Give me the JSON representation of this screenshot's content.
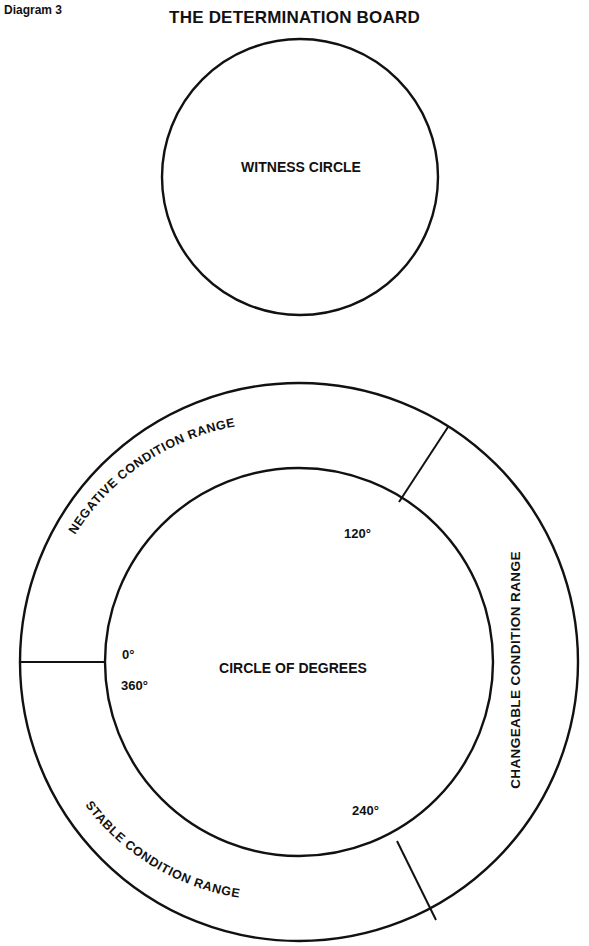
{
  "header": {
    "diagram_number": "Diagram 3",
    "title": "THE DETERMINATION BOARD"
  },
  "witness_circle": {
    "label": "WITNESS CIRCLE"
  },
  "degree_circle": {
    "label": "CIRCLE OF DEGREES",
    "marks": {
      "zero": "0°",
      "three_sixty": "360°",
      "one_twenty": "120°",
      "two_forty": "240°"
    }
  },
  "ranges": {
    "negative": "NEGATIVE CONDITION RANGE",
    "changeable": "CHANGEABLE CONDITION RANGE",
    "stable": "STABLE CONDITION RANGE"
  },
  "colors": {
    "ink": "#111111",
    "paper": "#ffffff"
  }
}
